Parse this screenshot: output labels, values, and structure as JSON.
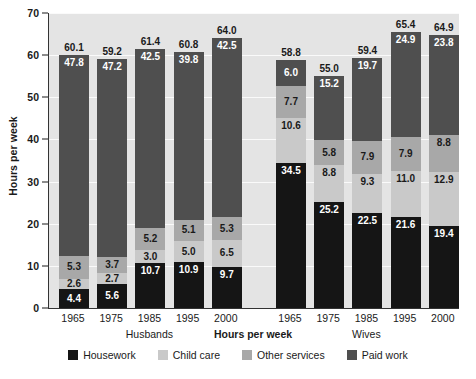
{
  "chart_data": {
    "type": "bar",
    "stacked": true,
    "title": "",
    "xlabel": "Hours per week",
    "ylabel": "Hours per week",
    "ylim": [
      0,
      70
    ],
    "ytick_step": 10,
    "yticks": [
      0,
      10,
      20,
      30,
      40,
      50,
      60,
      70
    ],
    "grid": true,
    "legend_position": "bottom",
    "categories": [
      "1965",
      "1975",
      "1985",
      "1995",
      "2000",
      "1965",
      "1975",
      "1985",
      "1995",
      "2000"
    ],
    "groups": [
      {
        "name": "Husbands",
        "categories": [
          "1965",
          "1975",
          "1985",
          "1995",
          "2000"
        ]
      },
      {
        "name": "Wives",
        "categories": [
          "1965",
          "1975",
          "1985",
          "1995",
          "2000"
        ]
      }
    ],
    "series": [
      {
        "name": "Housework",
        "color": "#151515",
        "values": [
          4.4,
          5.6,
          10.7,
          10.9,
          9.7,
          34.5,
          25.2,
          22.5,
          21.6,
          19.4
        ]
      },
      {
        "name": "Child care",
        "color": "#c9c9c9",
        "values": [
          2.6,
          2.7,
          3.0,
          5.0,
          6.5,
          10.6,
          8.8,
          9.3,
          11.0,
          12.9
        ]
      },
      {
        "name": "Other services",
        "color": "#a8a8a8",
        "values": [
          5.3,
          3.7,
          5.2,
          5.1,
          5.3,
          7.7,
          5.8,
          7.9,
          7.9,
          8.8
        ]
      },
      {
        "name": "Paid work",
        "color": "#4f4f4f",
        "values": [
          47.8,
          47.2,
          42.5,
          39.8,
          42.5,
          6.0,
          15.2,
          19.7,
          24.9,
          23.8
        ]
      }
    ],
    "totals": [
      60.1,
      59.2,
      61.4,
      60.8,
      64.0,
      58.8,
      55.0,
      59.4,
      65.4,
      64.9
    ],
    "stack_order_bottom_to_top": [
      "Housework",
      "Child care",
      "Other services",
      "Paid work"
    ],
    "label_text_color_by_series": {
      "Housework": "light",
      "Child care": "dark",
      "Other services": "dark",
      "Paid work": "light"
    },
    "plot_background": "#e4e4e4",
    "gridline_color": "#fafafa"
  }
}
